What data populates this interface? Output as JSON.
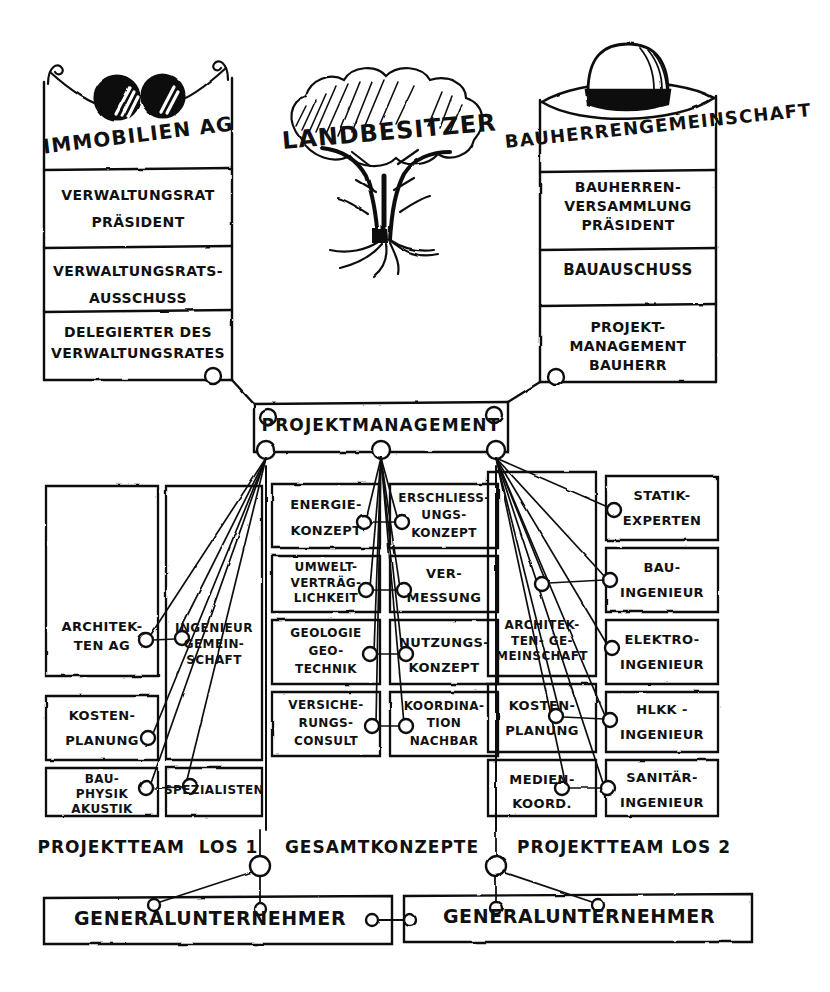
{
  "diagram": {
    "stroke_color": "#111111",
    "background_color": "#ffffff"
  },
  "pillars": {
    "left": {
      "icon": "sunglasses-icon",
      "header": "IMMOBILIEN AG",
      "boxes": [
        "VERWALTUNGSRAT\nPRÄSIDENT",
        "VERWALTUNGSRATS-\nAUSSCHUSS",
        "DELEGIERTER DES\nVERWALTUNGSRATES"
      ]
    },
    "center": {
      "icon": "tree-icon",
      "header": "LANDBESITZER"
    },
    "right": {
      "icon": "hat-icon",
      "header": "BAUHERRENGEMEINSCHAFT",
      "boxes": [
        "BAUHERREN-\nVERSAMMLUNG\nPRÄSIDENT",
        "BAUAUSCHUSS",
        "PROJEKT-\nMANAGEMENT\nBAUHERR"
      ]
    }
  },
  "project_management": {
    "label": "PROJEKTMANAGEMENT"
  },
  "columns": {
    "team_los1_a": {
      "group": "PROJEKTTEAM LOS 1",
      "boxes": [
        "ARCHITEK-\nTEN AG",
        "KOSTEN-\nPLANUNG",
        "BAU-\nPHYSIK\nAKUSTIK"
      ]
    },
    "team_los1_b": {
      "group": "PROJEKTTEAM LOS 1",
      "boxes": [
        "INGENIEUR\nGEMEIN-\nSCHAFT",
        "SPEZIALISTEN"
      ]
    },
    "gesamt_a": {
      "group": "GESAMTKONZEPTE",
      "boxes": [
        "ENERGIE-\nKONZEPT",
        "UMWELT-\nVERTRÄG-\nLICHKEIT",
        "GEOLOGIE\nGEO-\nTECHNIK",
        "VERSICHE-\nRUNGS-\nCONSULT"
      ]
    },
    "gesamt_b": {
      "group": "GESAMTKONZEPTE",
      "boxes": [
        "ERSCHLIESS-\nUNGS-\nKONZEPT",
        "VER-\nMESSUNG",
        "NUTZUNGS-\nKONZEPT",
        "KOORDINA-\nTION\nNACHBAR"
      ]
    },
    "team_los2_a": {
      "group": "PROJEKTTEAM LOS 2",
      "boxes": [
        "ARCHITEK-\nTEN- GE-\nMEINSCHAFT",
        "KOSTEN-\nPLANUNG",
        "MEDIEN-\nKOORD."
      ]
    },
    "team_los2_b": {
      "group": "PROJEKTTEAM LOS 2",
      "boxes": [
        "STATIK-\nEXPERTEN",
        "BAU-\nINGENIEUR",
        "ELEKTRO-\nINGENIEUR",
        "HLKK -\nINGENIEUR",
        "SANITÄR-\nINGENIEUR"
      ]
    }
  },
  "group_labels": {
    "left": "PROJEKTTEAM  LOS 1",
    "center": "GESAMTKONZEPTE",
    "right": "PROJEKTTEAM LOS 2"
  },
  "contractors": {
    "left": "GENERALUNTERNEHMER",
    "right": "GENERALUNTERNEHMER"
  }
}
